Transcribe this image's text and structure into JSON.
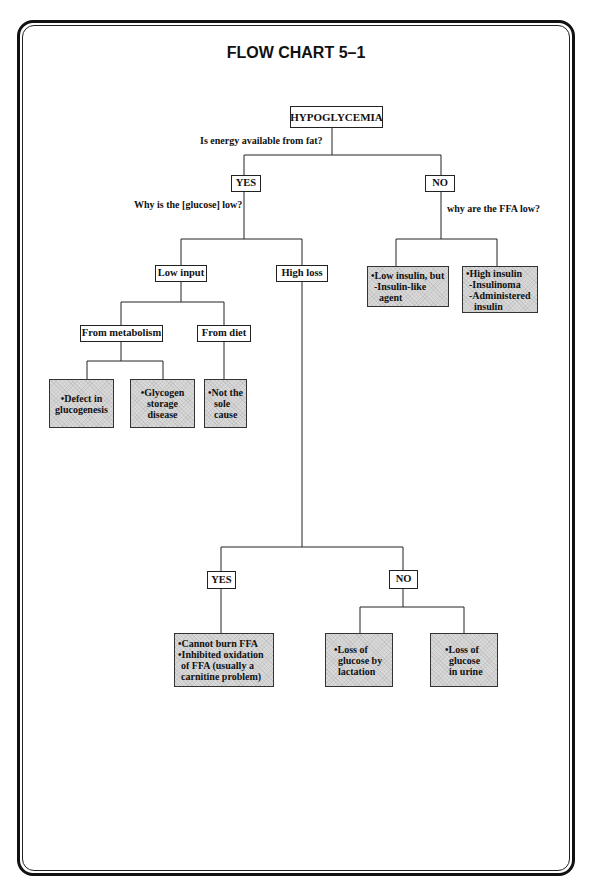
{
  "title": "FLOW CHART 5–1",
  "root": "HYPOGLYCEMIA",
  "questions": {
    "q1": "Is energy available from fat?",
    "q_yes": "Why is the [glucose] low?",
    "q_no": "why are the FFA low?"
  },
  "nodes": {
    "yes1": "YES",
    "no1": "NO",
    "low_input": "Low input",
    "high_loss": "High loss",
    "from_metabolism": "From metabolism",
    "from_diet": "From diet",
    "yes2": "YES",
    "no2": "NO"
  },
  "leaves": {
    "low_insulin": [
      "•Low insulin, but",
      " -Insulin-like",
      "  agent"
    ],
    "high_insulin": [
      "•High insulin",
      " -Insulinoma",
      " -Administered",
      "  insulin"
    ],
    "defect": [
      "•Defect in",
      "glucogenesis"
    ],
    "glycogen": [
      "•Glycogen",
      "storage",
      "disease"
    ],
    "not_sole": [
      "•Not the",
      "sole",
      "cause"
    ],
    "cannot_burn": [
      "•Cannot burn FFA",
      "•Inhibited oxidation",
      " of FFA (usually a",
      " carnitine problem)"
    ],
    "lactation": [
      "•Loss of",
      "glucose by",
      "lactation"
    ],
    "urine": [
      "•Loss of",
      "glucose",
      "in urine"
    ]
  }
}
